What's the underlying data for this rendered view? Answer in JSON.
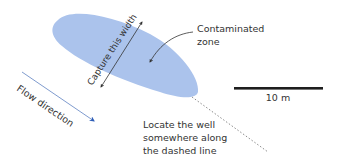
{
  "diagram": {
    "colors": {
      "plume": "#abc3ec",
      "flow_line": "#7190c8",
      "flow_head": "#2f5fb8",
      "annotation": "#333333",
      "scale_bar": "#1e1e1e",
      "dashed_line": "#8a8a8a"
    },
    "labels": {
      "contaminated_zone_line1": "Contaminated",
      "contaminated_zone_line2": "zone",
      "capture_width": "Capture this width",
      "flow_direction": "Flow direction",
      "scale": "10 m",
      "locate_well_line1": "Locate the well",
      "locate_well_line2": "somewhere along",
      "locate_well_line3": "the dashed line"
    },
    "icons": {
      "flow_arrow": "arrow-down-right-icon",
      "capture_arrow": "double-arrow-icon",
      "pointer_arrow": "curved-arrow-icon"
    }
  }
}
